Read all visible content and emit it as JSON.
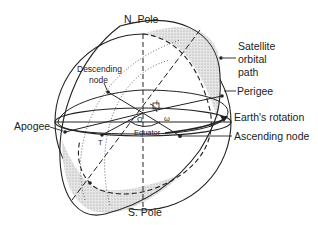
{
  "diagram": {
    "labels": {
      "north_pole": "N. Pole",
      "south_pole": "S. Pole",
      "descending_node_1": "Descending",
      "descending_node_2": "node",
      "satellite_path_1": "Satellite",
      "satellite_path_2": "orbital",
      "satellite_path_3": "path",
      "perigee": "Perigee",
      "apogee": "Apogee",
      "earths_rotation": "Earth's rotation",
      "ascending_node": "Ascending node",
      "equator": "Equator",
      "omega_upper": "Ω",
      "omega_lower": "ω",
      "inclination": "i",
      "T": "T"
    },
    "colors": {
      "line": "#222222",
      "shade": "#d9d9d9",
      "background": "#ffffff"
    }
  }
}
